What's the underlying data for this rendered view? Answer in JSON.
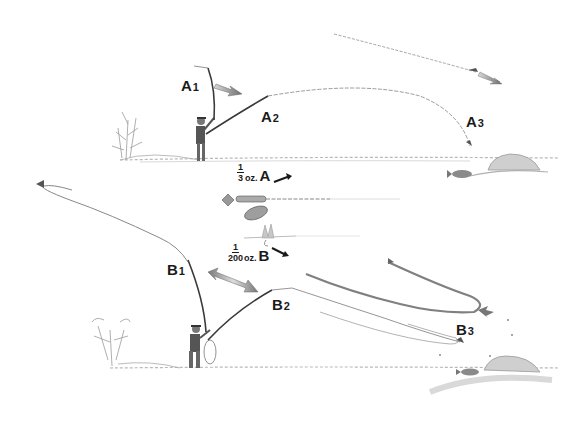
{
  "figure": {
    "labels": {
      "a1": {
        "letter": "A",
        "num": "1"
      },
      "a2": {
        "letter": "A",
        "num": "2"
      },
      "a3": {
        "letter": "A",
        "num": "3"
      },
      "b1": {
        "letter": "B",
        "num": "1"
      },
      "b2": {
        "letter": "B",
        "num": "2"
      },
      "b3": {
        "letter": "B",
        "num": "3"
      }
    },
    "weights": {
      "a": {
        "numerator": "1",
        "denominator": "3",
        "unit": "oz.",
        "letter": "A"
      },
      "b": {
        "numerator": "1",
        "denominator": "200",
        "unit": "oz.",
        "letter": "B"
      }
    },
    "elements": {
      "lure": "spinner-lure",
      "fly": "dry-fly",
      "ink_color": "#2a2a2a",
      "arrow_fill": "#8a8a8a",
      "sketch_gray": "#9a9a9a"
    }
  }
}
